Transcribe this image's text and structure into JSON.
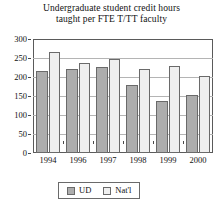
{
  "chart_data": {
    "type": "bar",
    "title": "Undergraduate student credit hours taught per FTE T/TT faculty",
    "title_lines": [
      "Undergraduate student credit hours",
      "taught per FTE T/TT faculty"
    ],
    "xlabel": "",
    "ylabel": "",
    "categories": [
      "1994",
      "1996",
      "1997",
      "1998",
      "1999",
      "2000"
    ],
    "series": [
      {
        "name": "UD",
        "color": "#adadad",
        "values": [
          215,
          222,
          226,
          178,
          138,
          153
        ]
      },
      {
        "name": "Nat'l",
        "color": "#efefef",
        "values": [
          265,
          238,
          248,
          222,
          228,
          202
        ]
      }
    ],
    "ylim": [
      0,
      300
    ],
    "ytick_values": [
      0,
      50,
      100,
      150,
      200,
      250,
      300
    ],
    "ytick_labels": [
      "0",
      "50",
      "100",
      "150",
      "200",
      "250",
      "300"
    ],
    "grid": true,
    "grid_axis": "y",
    "legend": {
      "position": "bottom-center",
      "entries": [
        {
          "label": "UD",
          "swatch": "ud"
        },
        {
          "label": "Nat'l",
          "swatch": "natl"
        }
      ]
    }
  }
}
